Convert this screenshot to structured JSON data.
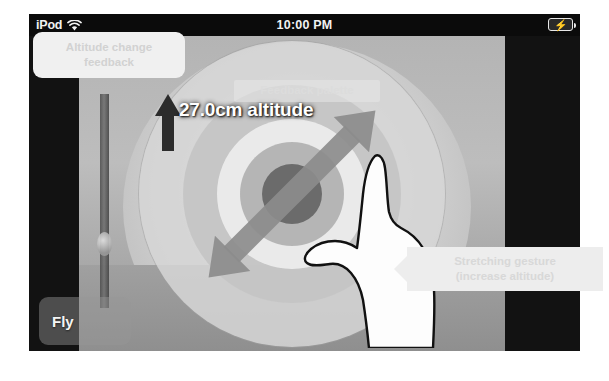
{
  "status_bar": {
    "carrier": "iPod",
    "wifi_icon": "wifi-icon",
    "time": "10:00 PM",
    "battery_icon": "battery-charging-icon"
  },
  "hud": {
    "altitude_value": "27.0cm",
    "altitude_label": "altitude",
    "up_arrow_icon": "arrow-up-icon",
    "stretch_arrow_icon": "double-arrow-diagonal-icon",
    "target_icon": "concentric-target-icon",
    "hand_icon": "hand-pinch-gesture-icon"
  },
  "controls": {
    "fly_label": "Fly"
  },
  "annotations": [
    {
      "id": "altitude-change-feedback",
      "line1": "Altitude change",
      "line2": "feedback"
    },
    {
      "id": "feedback-palette",
      "line1": "Feedback palette",
      "line2": ""
    },
    {
      "id": "stretching-gesture",
      "line1": "Stretching gesture",
      "line2": "(increase altitude)"
    }
  ],
  "colors": {
    "status_bar_bg": "#0b0b0b",
    "letterbox": "#101010",
    "hud_text": "#ffffff",
    "callout_bg": "#f0f0f0",
    "callout_text": "#d2d2d2",
    "arrow_dark": "#2c2c2c",
    "arrow_grey": "#8c8c8c"
  }
}
